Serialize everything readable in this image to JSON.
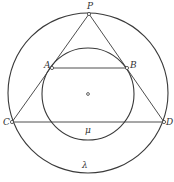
{
  "diagram": {
    "title": "",
    "colors": {
      "stroke": "#3a3a3a",
      "background": "#ffffff",
      "label": "#333333"
    },
    "circles": [
      {
        "name": "lambda",
        "label": "λ",
        "cx": 88,
        "cy": 93,
        "r": 80
      },
      {
        "name": "mu",
        "label": "μ",
        "cx": 88,
        "cy": 94,
        "r": 46
      }
    ],
    "center_point": {
      "x": 88,
      "y": 94
    },
    "points": [
      {
        "label": "P",
        "x": 89,
        "y": 14,
        "lx": 87,
        "ly": 9
      },
      {
        "label": "A",
        "x": 52,
        "y": 68,
        "lx": 44,
        "ly": 68
      },
      {
        "label": "B",
        "x": 127,
        "y": 68,
        "lx": 130,
        "ly": 68
      },
      {
        "label": "C",
        "x": 12,
        "y": 122,
        "lx": 3,
        "ly": 125
      },
      {
        "label": "D",
        "x": 164,
        "y": 122,
        "lx": 166,
        "ly": 125
      }
    ],
    "segments": [
      [
        "P",
        "C"
      ],
      [
        "P",
        "D"
      ],
      [
        "A",
        "B"
      ],
      [
        "C",
        "D"
      ]
    ],
    "circle_labels": [
      {
        "text": "μ",
        "x": 85,
        "y": 133
      },
      {
        "text": "λ",
        "x": 82,
        "y": 168
      }
    ]
  }
}
